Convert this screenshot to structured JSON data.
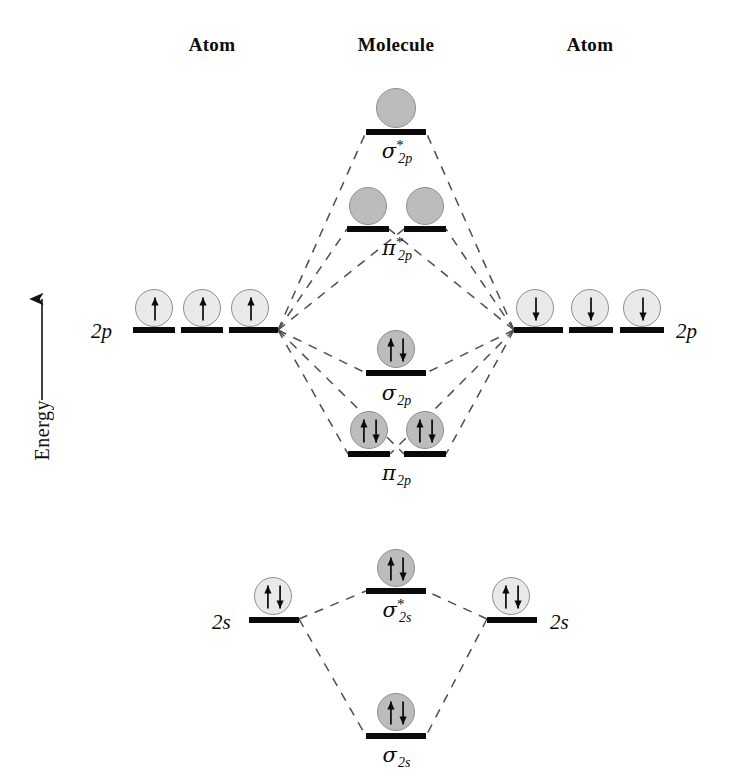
{
  "headers": [
    {
      "label": "Atom",
      "x": 212,
      "y": 34
    },
    {
      "label": "Molecule",
      "x": 396,
      "y": 34
    },
    {
      "label": "Atom",
      "x": 590,
      "y": 34
    }
  ],
  "axis": {
    "label": "Energy",
    "arrow_x": 42,
    "arrow_top": 293,
    "arrow_bottom": 392,
    "label_x": 31,
    "label_y": 400
  },
  "levels": [
    {
      "name": "sigma-star-2p",
      "kind": "molecular",
      "label": {
        "glyph": "σ",
        "star": true,
        "sub": "2p",
        "x": 396,
        "y": 141
      },
      "bars": [
        {
          "x": 366,
          "y": 129,
          "w": 60
        }
      ],
      "electrons": [
        {
          "cx": 396,
          "cy": 108,
          "r": 20,
          "shade": "dark",
          "spins": []
        }
      ]
    },
    {
      "name": "pi-star-2p",
      "kind": "molecular",
      "label": {
        "glyph": "π",
        "star": true,
        "sub": "2p",
        "x": 396,
        "y": 238
      },
      "bars": [
        {
          "x": 347,
          "y": 226,
          "w": 42
        },
        {
          "x": 404,
          "y": 226,
          "w": 42
        }
      ],
      "electrons": [
        {
          "cx": 368,
          "cy": 206,
          "r": 19,
          "shade": "dark",
          "spins": []
        },
        {
          "cx": 425,
          "cy": 206,
          "r": 19,
          "shade": "dark",
          "spins": []
        }
      ]
    },
    {
      "name": "atom-left-2p",
      "kind": "atomic",
      "label": {
        "text": "2p",
        "x": 91,
        "y": 319
      },
      "bars": [
        {
          "x": 133,
          "y": 327,
          "w": 42
        },
        {
          "x": 181,
          "y": 327,
          "w": 42
        },
        {
          "x": 229,
          "y": 327,
          "w": 49
        }
      ],
      "electrons": [
        {
          "cx": 154,
          "cy": 308,
          "r": 19,
          "shade": "light",
          "spins": [
            "up"
          ]
        },
        {
          "cx": 202,
          "cy": 308,
          "r": 19,
          "shade": "light",
          "spins": [
            "up"
          ]
        },
        {
          "cx": 250,
          "cy": 308,
          "r": 19,
          "shade": "light",
          "spins": [
            "up"
          ]
        }
      ]
    },
    {
      "name": "atom-right-2p",
      "kind": "atomic",
      "label": {
        "text": "2p",
        "x": 676,
        "y": 319
      },
      "bars": [
        {
          "x": 514,
          "y": 327,
          "w": 49
        },
        {
          "x": 569,
          "y": 327,
          "w": 44
        },
        {
          "x": 620,
          "y": 327,
          "w": 44
        }
      ],
      "electrons": [
        {
          "cx": 535,
          "cy": 308,
          "r": 19,
          "shade": "light",
          "spins": [
            "down"
          ]
        },
        {
          "cx": 590,
          "cy": 308,
          "r": 19,
          "shade": "light",
          "spins": [
            "down"
          ]
        },
        {
          "cx": 642,
          "cy": 308,
          "r": 19,
          "shade": "light",
          "spins": [
            "down"
          ]
        }
      ]
    },
    {
      "name": "sigma-2p",
      "kind": "molecular",
      "label": {
        "glyph": "σ",
        "star": false,
        "sub": "2p",
        "x": 396,
        "y": 383
      },
      "bars": [
        {
          "x": 366,
          "y": 370,
          "w": 60
        }
      ],
      "electrons": [
        {
          "cx": 396,
          "cy": 349,
          "r": 19,
          "shade": "dark",
          "spins": [
            "up",
            "down"
          ]
        }
      ]
    },
    {
      "name": "pi-2p",
      "kind": "molecular",
      "label": {
        "glyph": "π",
        "star": false,
        "sub": "2p",
        "x": 396,
        "y": 463
      },
      "bars": [
        {
          "x": 348,
          "y": 451,
          "w": 42
        },
        {
          "x": 404,
          "y": 451,
          "w": 42
        }
      ],
      "electrons": [
        {
          "cx": 369,
          "cy": 430,
          "r": 19,
          "shade": "dark",
          "spins": [
            "up",
            "down"
          ]
        },
        {
          "cx": 425,
          "cy": 430,
          "r": 19,
          "shade": "dark",
          "spins": [
            "up",
            "down"
          ]
        }
      ]
    },
    {
      "name": "sigma-star-2s",
      "kind": "molecular",
      "label": {
        "glyph": "σ",
        "star": true,
        "sub": "2s",
        "x": 396,
        "y": 600
      },
      "bars": [
        {
          "x": 366,
          "y": 588,
          "w": 60
        }
      ],
      "electrons": [
        {
          "cx": 396,
          "cy": 568,
          "r": 19,
          "shade": "dark",
          "spins": [
            "up",
            "down"
          ]
        }
      ]
    },
    {
      "name": "atom-left-2s",
      "kind": "atomic",
      "label": {
        "text": "2s",
        "x": 212,
        "y": 610
      },
      "bars": [
        {
          "x": 249,
          "y": 617,
          "w": 50
        }
      ],
      "electrons": [
        {
          "cx": 273,
          "cy": 596,
          "r": 19,
          "shade": "light",
          "spins": [
            "up",
            "down"
          ]
        }
      ]
    },
    {
      "name": "atom-right-2s",
      "kind": "atomic",
      "label": {
        "text": "2s",
        "x": 550,
        "y": 610
      },
      "bars": [
        {
          "x": 487,
          "y": 617,
          "w": 50
        }
      ],
      "electrons": [
        {
          "cx": 511,
          "cy": 596,
          "r": 19,
          "shade": "light",
          "spins": [
            "up",
            "down"
          ]
        }
      ]
    },
    {
      "name": "sigma-2s",
      "kind": "molecular",
      "label": {
        "glyph": "σ",
        "star": false,
        "sub": "2s",
        "x": 396,
        "y": 745
      },
      "bars": [
        {
          "x": 366,
          "y": 733,
          "w": 60
        }
      ],
      "electrons": [
        {
          "cx": 396,
          "cy": 712,
          "r": 19,
          "shade": "dark",
          "spins": [
            "up",
            "down"
          ]
        }
      ]
    }
  ],
  "correlation_lines": [
    {
      "from": [
        278,
        330
      ],
      "to": [
        366,
        132
      ]
    },
    {
      "from": [
        278,
        330
      ],
      "to": [
        347,
        229
      ]
    },
    {
      "from": [
        278,
        330
      ],
      "to": [
        404,
        229
      ]
    },
    {
      "from": [
        278,
        330
      ],
      "to": [
        366,
        373
      ]
    },
    {
      "from": [
        278,
        330
      ],
      "to": [
        348,
        454
      ]
    },
    {
      "from": [
        278,
        330
      ],
      "to": [
        404,
        454
      ]
    },
    {
      "from": [
        514,
        330
      ],
      "to": [
        426,
        132
      ]
    },
    {
      "from": [
        514,
        330
      ],
      "to": [
        446,
        229
      ]
    },
    {
      "from": [
        514,
        330
      ],
      "to": [
        389,
        229
      ]
    },
    {
      "from": [
        514,
        330
      ],
      "to": [
        426,
        373
      ]
    },
    {
      "from": [
        514,
        330
      ],
      "to": [
        446,
        454
      ]
    },
    {
      "from": [
        514,
        330
      ],
      "to": [
        390,
        454
      ]
    },
    {
      "from": [
        299,
        619
      ],
      "to": [
        366,
        591
      ]
    },
    {
      "from": [
        299,
        619
      ],
      "to": [
        366,
        736
      ]
    },
    {
      "from": [
        487,
        619
      ],
      "to": [
        426,
        591
      ]
    },
    {
      "from": [
        487,
        619
      ],
      "to": [
        426,
        736
      ]
    }
  ],
  "colors": {
    "bar": "#0a0a0a",
    "orbital_light": "#e9e9e9",
    "orbital_dark": "#bcbcbc",
    "orbital_border": "#8f8f8f",
    "line": "#4d4d4d",
    "text": "#0b0b0b"
  }
}
